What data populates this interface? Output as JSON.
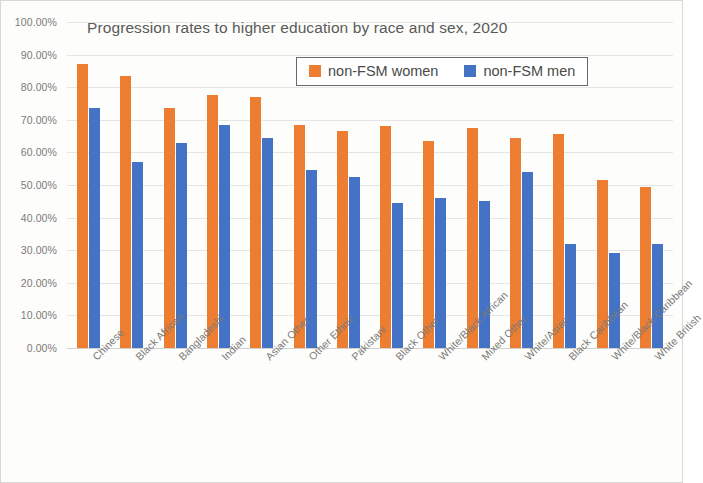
{
  "chart_data": {
    "type": "bar",
    "title": "Progression rates to higher education by race and sex, 2020",
    "xlabel": "",
    "ylabel": "",
    "ylim": [
      0,
      100
    ],
    "grid": true,
    "legend_position": "top-right-inside",
    "y_ticks": [
      "0.00%",
      "10.00%",
      "20.00%",
      "30.00%",
      "40.00%",
      "50.00%",
      "60.00%",
      "70.00%",
      "80.00%",
      "90.00%",
      "100.00%"
    ],
    "y_tick_values": [
      0,
      10,
      20,
      30,
      40,
      50,
      60,
      70,
      80,
      90,
      100
    ],
    "categories": [
      "Chinese",
      "Black African",
      "Bangladeshi",
      "Indian",
      "Asian Other",
      "Other Ethnic",
      "Pakistani",
      "Black Other",
      "White/Black African",
      "Mixed Other",
      "White/Asian",
      "Black Caribbean",
      "White/Black Caribbean",
      "White British"
    ],
    "series": [
      {
        "name": "non-FSM women",
        "color": "#ED7D31",
        "values": [
          87.0,
          83.5,
          73.5,
          77.5,
          77.0,
          68.5,
          66.5,
          68.0,
          63.5,
          67.5,
          64.5,
          65.5,
          51.5,
          49.5
        ]
      },
      {
        "name": "non-FSM men",
        "color": "#4472C4",
        "values": [
          73.5,
          57.0,
          63.0,
          68.5,
          64.5,
          54.5,
          52.5,
          44.5,
          46.0,
          45.0,
          54.0,
          32.0,
          29.0,
          32.0
        ]
      }
    ]
  }
}
